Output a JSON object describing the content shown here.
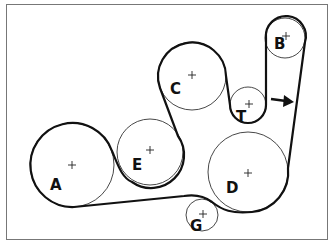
{
  "diagram": {
    "type": "serpentine-belt-routing",
    "pulleys": [
      {
        "id": "A",
        "label": "A",
        "cx": 72,
        "cy": 165,
        "r": 42,
        "lx": 50,
        "ly": 190
      },
      {
        "id": "E",
        "label": "E",
        "cx": 150,
        "cy": 152,
        "r": 33,
        "lx": 132,
        "ly": 170
      },
      {
        "id": "C",
        "label": "C",
        "cx": 192,
        "cy": 76,
        "r": 34,
        "lx": 170,
        "ly": 94
      },
      {
        "id": "T",
        "label": "T",
        "cx": 248,
        "cy": 105,
        "r": 18,
        "lx": 236,
        "ly": 122
      },
      {
        "id": "B",
        "label": "B",
        "cx": 285,
        "cy": 38,
        "r": 20,
        "lx": 274,
        "ly": 48
      },
      {
        "id": "D",
        "label": "D",
        "cx": 248,
        "cy": 172,
        "r": 40,
        "lx": 226,
        "ly": 193
      },
      {
        "id": "G",
        "label": "G",
        "cx": 202,
        "cy": 215,
        "r": 16,
        "lx": 190,
        "ly": 230
      }
    ],
    "arrow": {
      "direction": "right",
      "meaning": "belt-tensioner-direction"
    }
  }
}
